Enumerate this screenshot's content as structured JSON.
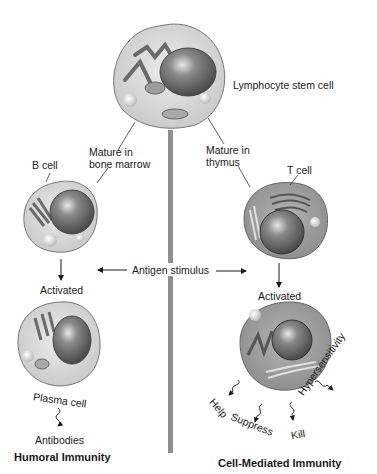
{
  "diagram": {
    "title_nodes": {
      "stem_cell": "Lymphocyte stem cell",
      "mature_bone_marrow_line1": "Mature in",
      "mature_bone_marrow_line2": "bone marrow",
      "mature_thymus_line1": "Mature in",
      "mature_thymus_line2": "thymus",
      "b_cell": "B cell",
      "t_cell": "T cell",
      "antigen_stimulus": "Antigen stimulus",
      "b_activated": "Activated",
      "t_activated": "Activated",
      "plasma_cell": "Plasma cell",
      "antibodies": "Antibodies",
      "humoral": "Humoral Immunity",
      "cell_mediated": "Cell-Mediated Immunity"
    },
    "t_cell_functions": [
      "Help",
      "Suppress",
      "Kill",
      "Hypersensitivity"
    ],
    "colors": {
      "cell_light": "#d9d9d9",
      "cell_dark": "#9a9a9a",
      "nucleus": "#6e6e6e",
      "divider": "#8e8e8e",
      "text": "#1a1a1a"
    }
  }
}
